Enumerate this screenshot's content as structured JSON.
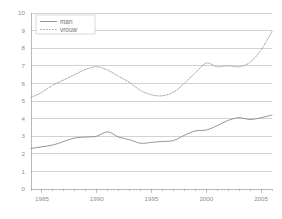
{
  "chart_data": {
    "type": "line",
    "title": "",
    "xlabel": "",
    "ylabel": "",
    "xlim": [
      1984,
      2006
    ],
    "ylim": [
      0,
      10
    ],
    "grid": true,
    "legend_position": "top-left",
    "y_ticks": [
      "0",
      "1",
      "2",
      "3",
      "4",
      "5",
      "6",
      "7",
      "8",
      "9",
      "10"
    ],
    "y_tick_values": [
      0,
      1,
      2,
      3,
      4,
      5,
      6,
      7,
      8,
      9,
      10
    ],
    "x_ticks": [
      "1985",
      "1990",
      "1995",
      "2000",
      "2005"
    ],
    "x_tick_values": [
      1985,
      1990,
      1995,
      2000,
      2005
    ],
    "x": [
      1984,
      1985,
      1986,
      1987,
      1988,
      1989,
      1990,
      1991,
      1992,
      1993,
      1994,
      1995,
      1996,
      1997,
      1998,
      1999,
      2000,
      2001,
      2002,
      2003,
      2004,
      2005,
      2006
    ],
    "series": [
      {
        "name": "man",
        "style": "solid",
        "color": "#8a8a8a",
        "values": [
          2.3,
          2.4,
          2.5,
          2.7,
          2.9,
          2.95,
          3.0,
          3.25,
          2.95,
          2.8,
          2.6,
          2.65,
          2.7,
          2.75,
          3.05,
          3.3,
          3.35,
          3.6,
          3.9,
          4.05,
          3.95,
          4.05,
          4.2
        ]
      },
      {
        "name": "vrouw",
        "style": "dashed",
        "color": "#9e9e9e",
        "values": [
          5.2,
          5.5,
          5.9,
          6.2,
          6.5,
          6.8,
          6.95,
          6.75,
          6.4,
          6.05,
          5.6,
          5.35,
          5.3,
          5.5,
          6.0,
          6.6,
          7.15,
          6.95,
          7.0,
          6.95,
          7.2,
          7.9,
          8.95
        ]
      }
    ],
    "legend": [
      {
        "label": "man",
        "style": "solid"
      },
      {
        "label": "vrouw",
        "style": "dashed"
      }
    ]
  }
}
